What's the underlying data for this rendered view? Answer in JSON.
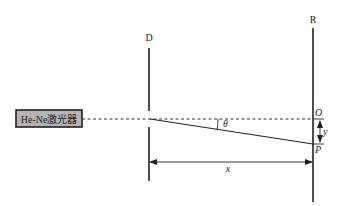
{
  "diagram": {
    "laser_label": "He-Ne激光器",
    "slit_label": "D",
    "screen_label": "R",
    "point_O": "O",
    "point_P": "P",
    "angle_label": "θ",
    "distance_x_label": "x",
    "distance_y_label": "y",
    "colors": {
      "line": "#222222",
      "laser_fill": "#b4b4b4",
      "background": "#ffffff"
    }
  }
}
